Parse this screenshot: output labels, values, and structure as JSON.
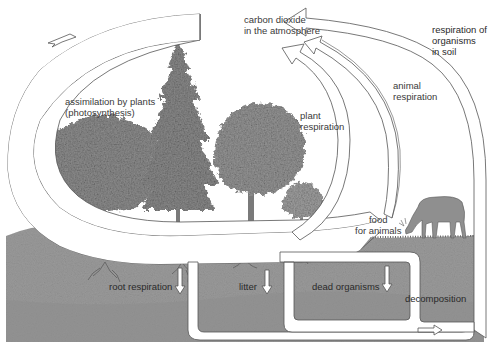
{
  "diagram": {
    "type": "carbon-cycle-illustration",
    "colors": {
      "background": "#ffffff",
      "soil": "#9a9a9a",
      "soil_dark": "#858585",
      "arrow_fill": "#ffffff",
      "arrow_stroke": "#555555",
      "foliage": "#8c8c8c",
      "trunk": "#777777",
      "text": "#3a3a3a"
    },
    "labels": {
      "co2": {
        "line1": "carbon dioxide",
        "line2": "in the atmosphere"
      },
      "assimilation": {
        "line1": "assimilation by plants",
        "line2": "(photosynthesis)"
      },
      "plant_respiration": {
        "line1": "plant",
        "line2": "respiration"
      },
      "animal_respiration": {
        "line1": "animal",
        "line2": "respiration"
      },
      "soil_respiration": {
        "line1": "respiration of",
        "line2": "organisms",
        "line3": "in soil"
      },
      "food": {
        "line1": "food",
        "line2": "for animals"
      },
      "root_respiration": "root respiration",
      "litter": "litter",
      "dead_organisms": "dead organisms",
      "decomposition": "decomposition"
    },
    "flows": [
      {
        "from": "carbon dioxide in the atmosphere",
        "to": "plants",
        "label": "assimilation by plants (photosynthesis)"
      },
      {
        "from": "plants",
        "to": "carbon dioxide in the atmosphere",
        "label": "plant respiration"
      },
      {
        "from": "animals",
        "to": "carbon dioxide in the atmosphere",
        "label": "animal respiration"
      },
      {
        "from": "soil",
        "to": "carbon dioxide in the atmosphere",
        "label": "respiration of organisms in soil"
      },
      {
        "from": "plants",
        "to": "animals",
        "label": "food for animals"
      },
      {
        "from": "plants",
        "to": "soil",
        "label": "root respiration"
      },
      {
        "from": "plants",
        "to": "soil",
        "label": "litter"
      },
      {
        "from": "animals",
        "to": "soil",
        "label": "dead organisms"
      },
      {
        "from": "soil",
        "to": "soil",
        "label": "decomposition"
      }
    ]
  }
}
